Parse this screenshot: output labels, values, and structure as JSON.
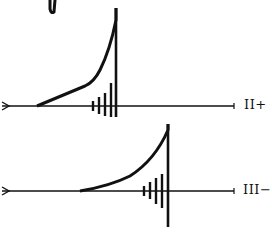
{
  "figure": {
    "colors": {
      "ink": "#111111",
      "background": "#ffffff"
    },
    "traces": [
      {
        "id": "top",
        "label": "II+",
        "baseline_y": 106,
        "curve_start_x": 37,
        "vertical_x": 116,
        "peak_y": 8,
        "vertical_bottom_y": 117,
        "tick_marks": [
          {
            "x": 93,
            "top": 101,
            "bottom": 111
          },
          {
            "x": 99,
            "top": 97,
            "bottom": 114
          },
          {
            "x": 105,
            "top": 93,
            "bottom": 116
          },
          {
            "x": 111,
            "top": 83,
            "bottom": 117
          }
        ]
      },
      {
        "id": "bottom",
        "label": "III−",
        "baseline_y": 191,
        "curve_start_x": 80,
        "vertical_x": 168,
        "peak_y": 124,
        "vertical_bottom_y": 227,
        "tick_marks": [
          {
            "x": 144,
            "top": 186,
            "bottom": 196
          },
          {
            "x": 150,
            "top": 182,
            "bottom": 199
          },
          {
            "x": 156,
            "top": 178,
            "bottom": 204
          },
          {
            "x": 162,
            "top": 174,
            "bottom": 208
          }
        ]
      }
    ]
  }
}
